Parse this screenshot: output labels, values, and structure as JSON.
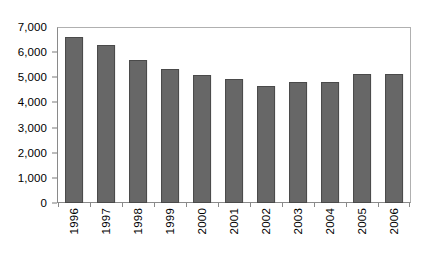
{
  "chart_data": {
    "type": "bar",
    "title": "",
    "subtitle": "",
    "xlabel": "",
    "ylabel": "",
    "categories": [
      "1996",
      "1997",
      "1998",
      "1999",
      "2000",
      "2001",
      "2002",
      "2003",
      "2004",
      "2005",
      "2006"
    ],
    "values": [
      6600,
      6300,
      5700,
      5350,
      5100,
      4950,
      4650,
      4800,
      4830,
      5120,
      5150
    ],
    "series": [
      {
        "name": "",
        "values": [
          6600,
          6300,
          5700,
          5350,
          5100,
          4950,
          4650,
          4800,
          4830,
          5120,
          5150
        ]
      }
    ],
    "ylim": [
      0,
      7000
    ],
    "ytick_values": [
      0,
      1000,
      2000,
      3000,
      4000,
      5000,
      6000,
      7000
    ],
    "ytick_labels": [
      "0",
      "1,000",
      "2,000",
      "3,000",
      "4,000",
      "5,000",
      "6,000",
      "7,000"
    ],
    "xtick_labels": [
      "1996",
      "1997",
      "1998",
      "1999",
      "2000",
      "2001",
      "2002",
      "2003",
      "2004",
      "2005",
      "2006"
    ],
    "xtick_label_rotation": 90,
    "grid": false,
    "legend": false,
    "legend_position": "none",
    "annotations": [],
    "colors": {
      "bar_fill": "#676767",
      "bar_border": "#4a4a4a",
      "plot_background": "#ffffff",
      "frame": "#8a8a8a",
      "text": "#000000"
    }
  }
}
